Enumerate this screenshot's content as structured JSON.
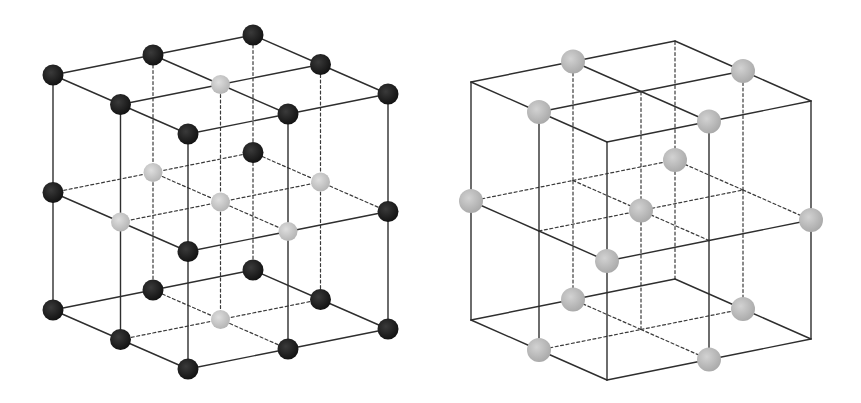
{
  "figure": {
    "colors": {
      "background": "#ffffff",
      "line": "#2e2e2e",
      "atom_dark": "#1b1b1b",
      "atom_light": "#c9c9c9",
      "atom_light_right": "#bcbcbc"
    },
    "lattices": [
      {
        "id": "left-lattice",
        "grid_divisions": 2,
        "atom_types": [
          "dark",
          "light"
        ],
        "rule": "dark when at most one index equals 1; light when two or more indices equal 1",
        "atoms": {
          "dark": [
            [
              0,
              0,
              0
            ],
            [
              1,
              0,
              0
            ],
            [
              2,
              0,
              0
            ],
            [
              0,
              1,
              0
            ],
            [
              2,
              1,
              0
            ],
            [
              0,
              2,
              0
            ],
            [
              1,
              2,
              0
            ],
            [
              2,
              2,
              0
            ],
            [
              0,
              0,
              1
            ],
            [
              2,
              0,
              1
            ],
            [
              0,
              2,
              1
            ],
            [
              2,
              2,
              1
            ],
            [
              0,
              0,
              2
            ],
            [
              1,
              0,
              2
            ],
            [
              2,
              0,
              2
            ],
            [
              0,
              1,
              2
            ],
            [
              2,
              1,
              2
            ],
            [
              0,
              2,
              2
            ],
            [
              1,
              2,
              2
            ],
            [
              2,
              2,
              2
            ]
          ],
          "light": [
            [
              1,
              1,
              0
            ],
            [
              1,
              0,
              1
            ],
            [
              0,
              1,
              1
            ],
            [
              1,
              1,
              1
            ],
            [
              2,
              1,
              1
            ],
            [
              1,
              2,
              1
            ],
            [
              1,
              1,
              2
            ]
          ]
        }
      },
      {
        "id": "right-lattice",
        "grid_divisions": 2,
        "atom_types": [
          "light"
        ],
        "atoms": {
          "light": [
            [
              1,
              0,
              0
            ],
            [
              0,
              1,
              0
            ],
            [
              2,
              1,
              0
            ],
            [
              1,
              2,
              0
            ],
            [
              0,
              0,
              1
            ],
            [
              2,
              0,
              1
            ],
            [
              0,
              2,
              1
            ],
            [
              2,
              2,
              1
            ],
            [
              1,
              1,
              1
            ],
            [
              1,
              0,
              2
            ],
            [
              0,
              1,
              2
            ],
            [
              2,
              1,
              2
            ],
            [
              1,
              2,
              2
            ]
          ]
        }
      }
    ]
  }
}
